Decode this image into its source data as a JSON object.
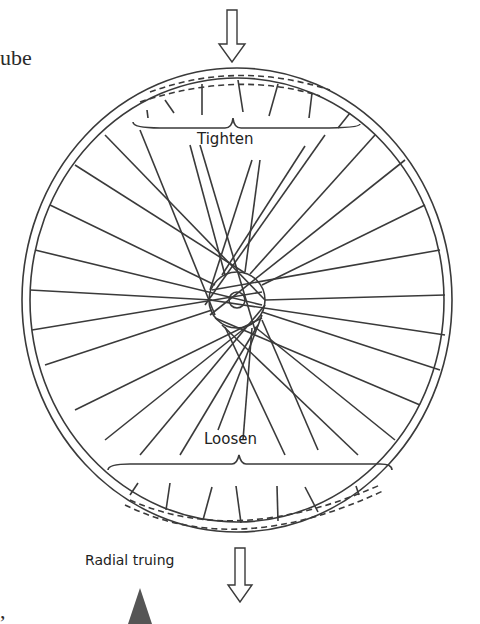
{
  "text_fragments": {
    "top_left": "ube",
    "bottom_left": ","
  },
  "labels": {
    "tighten": "Tighten",
    "loosen": "Loosen",
    "caption": "Radial truing"
  },
  "colors": {
    "line": "#3a3a3a",
    "triangle": "#555555",
    "background": "#ffffff"
  }
}
